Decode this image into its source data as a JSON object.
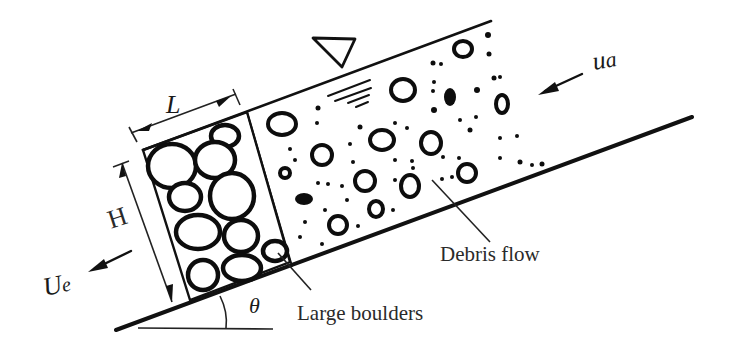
{
  "figure": {
    "labels": {
      "length": "L",
      "height": "H",
      "angle": "θ",
      "approach_velocity": "u",
      "approach_velocity_sub": "a",
      "exit_velocity": "U",
      "exit_velocity_sub": "e",
      "debris_flow": "Debris flow",
      "large_boulders": "Large boulders"
    },
    "symbols": {
      "free_surface": "water-surface-triangle-icon"
    },
    "colors": {
      "ink": "#111111",
      "background": "#ffffff"
    }
  }
}
